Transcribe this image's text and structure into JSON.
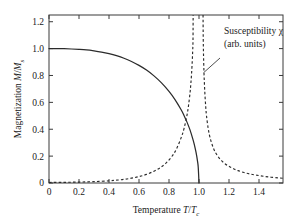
{
  "figure": {
    "background": "#ffffff",
    "foreground": "#2b2b2b"
  },
  "axes": {
    "x_label_prefix": "Temperature ",
    "x_label_var": "T",
    "x_label_slash": "/",
    "x_label_var2": "T",
    "x_label_sub": "c",
    "y_label_prefix": "Magnetization ",
    "y_label_var": "M",
    "y_label_slash": "/",
    "y_label_var2": "M",
    "y_label_sub": "s",
    "x_ticklabels": [
      "0",
      "0.2",
      "0.4",
      "0.6",
      "0.8",
      "1.0",
      "1.2",
      "1.4"
    ],
    "y_ticklabels": [
      "0",
      "0.2",
      "0.4",
      "0.6",
      "0.8",
      "1.0",
      "1.2"
    ]
  },
  "annotation": {
    "line1_text": "Susceptibility ",
    "line1_symbol": "χ",
    "line2": "(arb. units)"
  },
  "chart_data": {
    "type": "line",
    "title": "",
    "xlabel": "Temperature T/Tc",
    "ylabel": "Magnetization M/Ms",
    "xlim": [
      0,
      1.56
    ],
    "ylim": [
      0,
      1.25
    ],
    "xticks": [
      0,
      0.2,
      0.4,
      0.6,
      0.8,
      1.0,
      1.2,
      1.4
    ],
    "yticks": [
      0,
      0.2,
      0.4,
      0.6,
      0.8,
      1.0,
      1.2
    ],
    "grid": false,
    "legend": "none",
    "annotations": [
      {
        "text": "Susceptibility χ (arb. units)",
        "x": 1.16,
        "y": 1.1,
        "points_to_x": 1.03,
        "points_to_y": 0.82
      }
    ],
    "series": [
      {
        "name": "Magnetization M/Ms",
        "style": "solid",
        "x": [
          0.0,
          0.05,
          0.1,
          0.15,
          0.2,
          0.25,
          0.3,
          0.35,
          0.4,
          0.45,
          0.5,
          0.55,
          0.6,
          0.65,
          0.7,
          0.75,
          0.8,
          0.84,
          0.88,
          0.9,
          0.92,
          0.94,
          0.96,
          0.97,
          0.98,
          0.99,
          0.995,
          1.0
        ],
        "y": [
          1.0,
          1.0,
          0.999,
          0.997,
          0.994,
          0.99,
          0.983,
          0.974,
          0.962,
          0.947,
          0.928,
          0.904,
          0.875,
          0.84,
          0.797,
          0.745,
          0.682,
          0.621,
          0.547,
          0.503,
          0.453,
          0.395,
          0.323,
          0.28,
          0.229,
          0.163,
          0.115,
          0.0
        ]
      },
      {
        "name": "Susceptibility χ (arb. units)",
        "style": "dashed",
        "x": [
          0.0,
          0.1,
          0.2,
          0.3,
          0.4,
          0.45,
          0.5,
          0.55,
          0.6,
          0.65,
          0.7,
          0.74,
          0.78,
          0.82,
          0.85,
          0.88,
          0.9,
          0.92,
          0.93,
          0.94,
          0.945,
          0.95,
          0.955,
          0.958,
          0.96,
          0.961
        ],
        "y": [
          0.004,
          0.005,
          0.007,
          0.01,
          0.016,
          0.021,
          0.027,
          0.036,
          0.048,
          0.064,
          0.088,
          0.113,
          0.148,
          0.199,
          0.254,
          0.334,
          0.404,
          0.505,
          0.575,
          0.668,
          0.73,
          0.806,
          0.905,
          0.985,
          1.06,
          1.25
        ]
      },
      {
        "name": "Susceptibility χ (arb. units) high-T branch",
        "style": "dashed",
        "x": [
          1.027,
          1.028,
          1.03,
          1.033,
          1.036,
          1.04,
          1.045,
          1.05,
          1.06,
          1.07,
          1.08,
          1.095,
          1.11,
          1.13,
          1.15,
          1.175,
          1.2,
          1.23,
          1.26,
          1.3,
          1.34,
          1.38,
          1.43,
          1.48,
          1.53,
          1.56
        ],
        "y": [
          1.25,
          1.1,
          0.96,
          0.83,
          0.74,
          0.65,
          0.565,
          0.5,
          0.415,
          0.355,
          0.312,
          0.262,
          0.226,
          0.192,
          0.166,
          0.142,
          0.124,
          0.106,
          0.092,
          0.078,
          0.067,
          0.059,
          0.05,
          0.043,
          0.038,
          0.035
        ]
      }
    ]
  },
  "geometry": {
    "plot_left": 49,
    "plot_right": 283,
    "plot_top": 15,
    "plot_bottom": 183
  }
}
